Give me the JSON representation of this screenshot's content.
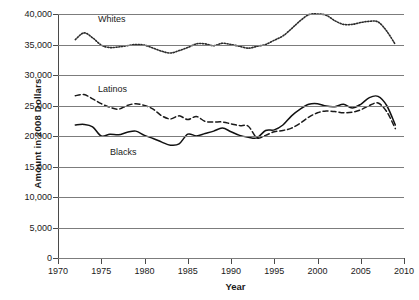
{
  "chart_data": {
    "type": "line",
    "title": "",
    "xlabel": "Year",
    "ylabel": "Amount in 2008 Dollars",
    "xlim": [
      1970,
      2010
    ],
    "ylim": [
      0,
      40000
    ],
    "grid": true,
    "legend_position": "inline-labels",
    "xticks": [
      "1970",
      "1975",
      "1980",
      "1985",
      "1990",
      "1995",
      "2000",
      "2005",
      "2010"
    ],
    "yticks": [
      "0",
      "5,000",
      "10,000",
      "15,000",
      "20,000",
      "25,000",
      "30,000",
      "35,000",
      "40,000"
    ],
    "series": [
      {
        "name": "Whites",
        "style": "dotted",
        "color": "#2b2b2b",
        "x": [
          1972,
          1973,
          1974,
          1975,
          1976,
          1977,
          1978,
          1979,
          1980,
          1981,
          1982,
          1983,
          1984,
          1985,
          1986,
          1987,
          1988,
          1989,
          1990,
          1991,
          1992,
          1993,
          1994,
          1995,
          1996,
          1997,
          1998,
          1999,
          2000,
          2001,
          2002,
          2003,
          2004,
          2005,
          2006,
          2007,
          2008,
          2009
        ],
        "values": [
          35800,
          36900,
          36100,
          34900,
          34500,
          34600,
          34800,
          35000,
          34900,
          34400,
          33900,
          33600,
          34000,
          34500,
          35100,
          35100,
          34800,
          35200,
          35000,
          34700,
          34400,
          34700,
          35000,
          35700,
          36400,
          37600,
          38900,
          39900,
          40000,
          39800,
          38900,
          38300,
          38300,
          38600,
          38800,
          38700,
          37200,
          35000
        ]
      },
      {
        "name": "Latinos",
        "style": "dashed",
        "color": "#1a1a1a",
        "x": [
          1972,
          1973,
          1974,
          1975,
          1976,
          1977,
          1978,
          1979,
          1980,
          1981,
          1982,
          1983,
          1984,
          1985,
          1986,
          1987,
          1988,
          1989,
          1990,
          1991,
          1992,
          1993,
          1994,
          1995,
          1996,
          1997,
          1998,
          1999,
          2000,
          2001,
          2002,
          2003,
          2004,
          2005,
          2006,
          2007,
          2008,
          2009
        ],
        "values": [
          26600,
          26800,
          26100,
          25300,
          24700,
          24400,
          25000,
          25300,
          25000,
          24400,
          23300,
          22800,
          23300,
          22700,
          23200,
          22400,
          22300,
          22300,
          22000,
          21700,
          21600,
          19700,
          20100,
          20700,
          20900,
          21300,
          22100,
          23100,
          23800,
          24100,
          24000,
          23800,
          23900,
          24300,
          25000,
          25400,
          24000,
          21200
        ]
      },
      {
        "name": "Blacks",
        "style": "solid",
        "color": "#111111",
        "x": [
          1972,
          1973,
          1974,
          1975,
          1976,
          1977,
          1978,
          1979,
          1980,
          1981,
          1982,
          1983,
          1984,
          1985,
          1986,
          1987,
          1988,
          1989,
          1990,
          1991,
          1992,
          1993,
          1994,
          1995,
          1996,
          1997,
          1998,
          1999,
          2000,
          2001,
          2002,
          2003,
          2004,
          2005,
          2006,
          2007,
          2008,
          2009
        ],
        "values": [
          21800,
          21900,
          21500,
          20000,
          20300,
          20200,
          20600,
          20800,
          20100,
          19600,
          19000,
          18500,
          18700,
          20300,
          20000,
          20400,
          20800,
          21300,
          20700,
          20100,
          19800,
          19700,
          20900,
          21000,
          21800,
          23300,
          24400,
          25200,
          25300,
          24900,
          24800,
          25200,
          24600,
          25200,
          26300,
          26500,
          25000,
          21800
        ]
      }
    ],
    "series_labels": {
      "whites": "Whites",
      "latinos": "Latinos",
      "blacks": "Blacks"
    }
  }
}
